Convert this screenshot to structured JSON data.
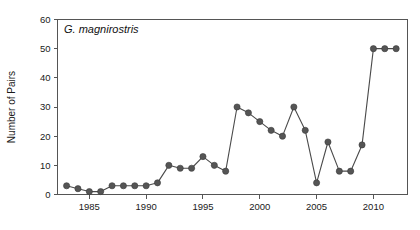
{
  "chart_data": {
    "type": "line",
    "title": "",
    "annotation": "G. magnirostris",
    "xlabel": "",
    "ylabel": "Number of Pairs",
    "xlim": [
      1982.2,
      2013.0
    ],
    "ylim": [
      0,
      60
    ],
    "grid": false,
    "legend": null,
    "yticks": [
      0,
      10,
      20,
      30,
      40,
      50,
      60
    ],
    "ytick_labels": [
      "0",
      "10",
      "20",
      "30",
      "40",
      "50",
      "60"
    ],
    "xticks": [
      1985,
      1990,
      1995,
      2000,
      2005,
      2010
    ],
    "xtick_labels": [
      "1985",
      "1990",
      "1995",
      "2000",
      "2005",
      "2010"
    ],
    "marker": "filled-circle",
    "marker_color": "#555555",
    "line_color": "#4a4a4a",
    "x": [
      1983,
      1984,
      1985,
      1986,
      1987,
      1988,
      1989,
      1990,
      1991,
      1992,
      1993,
      1994,
      1995,
      1996,
      1997,
      1998,
      1999,
      2000,
      2001,
      2002,
      2003,
      2004,
      2005,
      2006,
      2007,
      2008,
      2009,
      2010,
      2011,
      2012
    ],
    "values": [
      3,
      2,
      1,
      1,
      3,
      3,
      3,
      3,
      4,
      10,
      9,
      9,
      13,
      10,
      8,
      30,
      28,
      25,
      22,
      20,
      30,
      22,
      4,
      18,
      8,
      8,
      17,
      50,
      50,
      50
    ],
    "series": [
      {
        "name": "G. magnirostris",
        "x": [
          1983,
          1984,
          1985,
          1986,
          1987,
          1988,
          1989,
          1990,
          1991,
          1992,
          1993,
          1994,
          1995,
          1996,
          1997,
          1998,
          1999,
          2000,
          2001,
          2002,
          2003,
          2004,
          2005,
          2006,
          2007,
          2008,
          2009,
          2010,
          2011,
          2012
        ],
        "values": [
          3,
          2,
          1,
          1,
          3,
          3,
          3,
          3,
          4,
          10,
          9,
          9,
          13,
          10,
          8,
          30,
          28,
          25,
          22,
          20,
          30,
          22,
          4,
          18,
          8,
          8,
          17,
          50,
          50,
          50
        ]
      }
    ]
  }
}
